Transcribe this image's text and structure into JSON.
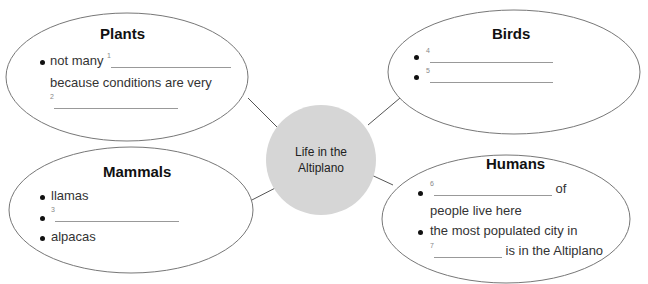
{
  "center": {
    "line1": "Life in the",
    "line2": "Altiplano",
    "fill": "#d6d6d6"
  },
  "plants": {
    "title": "Plants",
    "bullet1_text": "not many",
    "bullet1_num": "1",
    "bullet1_cont": "because conditions are very",
    "blank2_num": "2"
  },
  "birds": {
    "title": "Birds",
    "blank4_num": "4",
    "blank5_num": "5"
  },
  "mammals": {
    "title": "Mammals",
    "item1": "llamas",
    "blank3_num": "3",
    "item3": "alpacas"
  },
  "humans": {
    "title": "Humans",
    "blank6_num": "6",
    "bullet1_after": "of",
    "bullet1_cont": "people live here",
    "bullet2_text": "the most populated city in",
    "blank7_num": "7",
    "bullet2_after": "is in the Altiplano"
  },
  "colors": {
    "outline": "#777777",
    "connector": "#555555"
  }
}
